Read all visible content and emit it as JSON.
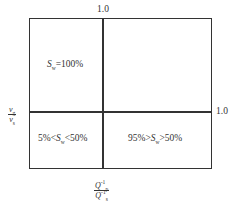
{
  "diagram": {
    "top_tick_label": "1.0",
    "right_tick_label": "1.0",
    "y_axis_label": {
      "numerator": "v",
      "numerator_sub": "g",
      "denominator": "v",
      "denominator_sub": "s"
    },
    "x_axis_label": {
      "numerator": "Q",
      "numerator_sup": "-1",
      "numerator_sub": "p",
      "denominator": "Q",
      "denominator_sup": "-1",
      "denominator_sub": "s"
    },
    "regions": [
      {
        "id": "top-left",
        "var": "S",
        "sub": "w",
        "text_before": "",
        "text_after": "=100%"
      },
      {
        "id": "top-right",
        "var": "",
        "sub": "",
        "text_before": "",
        "text_after": ""
      },
      {
        "id": "bottom-left",
        "var": "S",
        "sub": "w",
        "text_before": "5%<",
        "text_after": "<50%"
      },
      {
        "id": "bottom-right",
        "var": "S",
        "sub": "w",
        "text_before": "95%>",
        "text_after": ">50%"
      }
    ],
    "line_color": "#333333"
  }
}
